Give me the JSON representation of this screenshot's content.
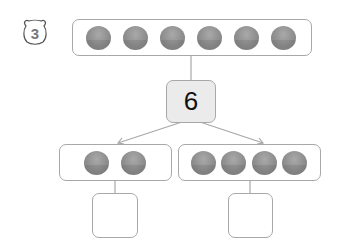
{
  "problem": {
    "number": "3",
    "number_icon": "bear-face-icon"
  },
  "diagram": {
    "top_group": {
      "coin_count": 6
    },
    "total": "6",
    "left_group": {
      "coin_count": 2
    },
    "right_group": {
      "coin_count": 4
    },
    "left_answer": "",
    "right_answer": "",
    "colors": {
      "coin": "#8f8f8f",
      "border": "#a8a8a8",
      "total_box_bg": "#ebebeb"
    }
  }
}
